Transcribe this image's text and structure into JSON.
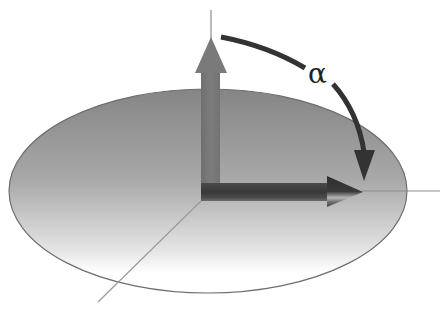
{
  "diagram": {
    "title": "",
    "angle_label": "α",
    "elements": {
      "plane": {
        "shape": "ellipse",
        "description": "horizontal plane (disc) seen in perspective"
      },
      "vertical_axis": {
        "description": "normal axis line"
      },
      "horizontal_axis": {
        "description": "in-plane axis line to the right"
      },
      "diagonal_axis": {
        "description": "in-plane axis line toward the viewer"
      },
      "vertical_arrow": {
        "description": "vector pointing up"
      },
      "horizontal_arrow": {
        "description": "vector pointing right, lying in plane"
      },
      "rotation_arc": {
        "description": "curved arrow from vertical to horizontal vector indicating angle alpha"
      }
    },
    "colors": {
      "plane_top": "#858585",
      "plane_bottom": "#ffffff",
      "plane_stroke": "#6e6e6e",
      "vertical_arrow": "#7a7a7a",
      "horizontal_arrow": "#3c3c3c",
      "arc": "#333333",
      "axis_lines": "#8c8c8c",
      "background": "#ffffff"
    }
  }
}
